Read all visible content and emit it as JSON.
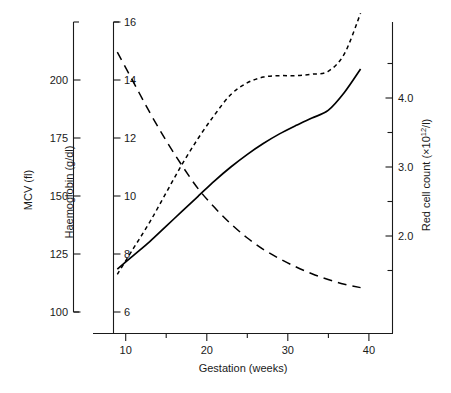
{
  "chart_data": {
    "type": "line",
    "title": "",
    "xlabel": "Gestation (weeks)",
    "xlim": [
      7,
      44
    ],
    "xticks": [
      10,
      20,
      30,
      40
    ],
    "xminorticks": [
      15,
      25,
      35
    ],
    "grid": false,
    "legend": "none",
    "axes": [
      {
        "id": "mcv",
        "position": "left-outer",
        "label": "MCV (fl)",
        "unit": "fl",
        "ticks": [
          100,
          125,
          150,
          175,
          200
        ],
        "lim": [
          95,
          212
        ]
      },
      {
        "id": "haemoglobin",
        "position": "left-inner",
        "label": "Haemoglobin (g/dl)",
        "unit": "g/dl",
        "ticks": [
          6,
          8,
          10,
          12,
          14,
          16
        ],
        "lim": [
          5.3,
          16.6
        ]
      },
      {
        "id": "redcellcount",
        "position": "right",
        "label": "Red cell count (×10",
        "label_sup": "12",
        "label_tail": "/l)",
        "label_full": "Red cell count (×10¹²/l)",
        "ticks": [
          2.0,
          3.0,
          4.0
        ],
        "minorticks": [
          1.5,
          2.5,
          3.5,
          4.5
        ],
        "lim": [
          1.35,
          4.85
        ]
      }
    ],
    "series": [
      {
        "name": "MCV",
        "axis": "mcv",
        "style": "long-dashed",
        "color": "#000000",
        "x": [
          10.0,
          12.0,
          14.0,
          16.0,
          18.0,
          20.0,
          22.0,
          24.0,
          26.0,
          28.0,
          30.0,
          32.0,
          34.0,
          36.0,
          38.0,
          40.0
        ],
        "values": [
          212.0,
          199.0,
          186.0,
          174.0,
          163.0,
          153.0,
          145.0,
          138.0,
          132.0,
          127.0,
          123.0,
          119.5,
          116.5,
          114.0,
          112.0,
          110.5
        ]
      },
      {
        "name": "Haemoglobin",
        "axis": "haemoglobin",
        "style": "short-dashed",
        "color": "#000000",
        "x": [
          10.0,
          12.0,
          14.0,
          16.0,
          18.0,
          20.0,
          22.0,
          24.0,
          26.0,
          28.0,
          30.0,
          32.0,
          34.0,
          36.0,
          38.0,
          40.0
        ],
        "values": [
          7.3,
          8.2,
          9.1,
          10.1,
          11.1,
          12.0,
          12.8,
          13.5,
          13.9,
          14.1,
          14.15,
          14.15,
          14.2,
          14.3,
          14.9,
          16.3
        ]
      },
      {
        "name": "Red cell count",
        "axis": "redcellcount",
        "style": "solid",
        "color": "#000000",
        "x": [
          10.0,
          12.0,
          14.0,
          16.0,
          18.0,
          20.0,
          22.0,
          24.0,
          26.0,
          28.0,
          30.0,
          32.0,
          34.0,
          36.0,
          38.0,
          40.0
        ],
        "values": [
          1.52,
          1.72,
          1.92,
          2.14,
          2.36,
          2.58,
          2.8,
          3.0,
          3.18,
          3.34,
          3.48,
          3.6,
          3.71,
          3.82,
          4.08,
          4.42
        ]
      }
    ]
  },
  "labels": {
    "mcv_axis_title": "MCV (fl)",
    "hb_axis_title": "Haemoglobin (g/dl)",
    "rcc_axis_title_head": "Red cell count (×10",
    "rcc_axis_title_sup": "12",
    "rcc_axis_title_tail": "/l)",
    "x_axis_title": "Gestation (weeks)",
    "mcv_ticks": [
      "200",
      "175",
      "150",
      "125",
      "100"
    ],
    "hb_ticks": [
      "16",
      "14",
      "12",
      "10",
      "8",
      "6"
    ],
    "rcc_ticks": [
      "4.0",
      "3.0",
      "2.0"
    ],
    "x_ticks": [
      "10",
      "20",
      "30",
      "40"
    ]
  }
}
